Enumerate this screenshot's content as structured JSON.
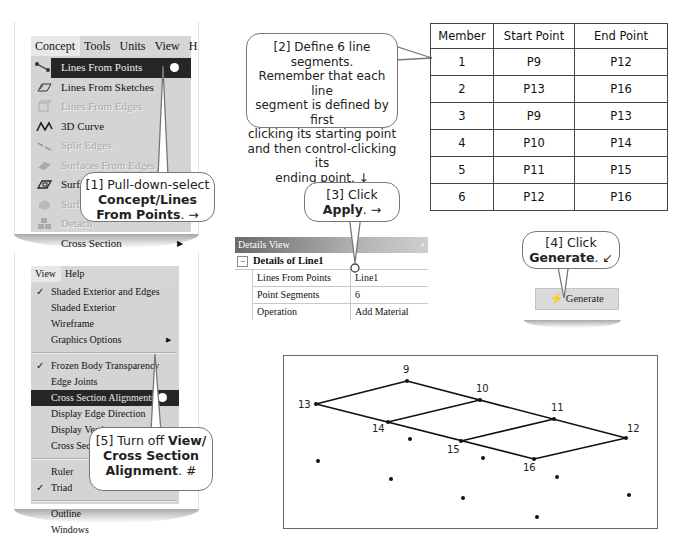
{
  "concept_menu": {
    "menubar": [
      "Concept",
      "Tools",
      "Units",
      "View",
      "H"
    ],
    "items": [
      {
        "label": "Lines From Points",
        "icon": "lines-from-points-icon",
        "state": "active"
      },
      {
        "label": "Lines From Sketches",
        "icon": "lines-from-sketches-icon",
        "state": "enabled"
      },
      {
        "label": "Lines From Edges",
        "icon": "lines-from-edges-icon",
        "state": "disabled"
      },
      {
        "label": "3D Curve",
        "icon": "3d-curve-icon",
        "state": "enabled"
      },
      {
        "label": "Split Edges",
        "icon": "split-edges-icon",
        "state": "disabled"
      },
      {
        "label": "Surfaces From Edges",
        "icon": "surfaces-from-edges-icon",
        "state": "disabled"
      },
      {
        "label": "Surfaces From Sketches",
        "icon": "surfaces-from-sketches-icon",
        "state": "enabled"
      },
      {
        "label": "Surfaces From Faces",
        "icon": "surfaces-from-faces-icon",
        "state": "disabled"
      },
      {
        "label": "Detach",
        "icon": "detach-icon",
        "state": "disabled"
      },
      {
        "label": "Cross Section",
        "icon": "",
        "state": "submenu"
      }
    ]
  },
  "view_menu": {
    "menubar": [
      "View",
      "Help"
    ],
    "groups": [
      [
        {
          "label": "Shaded Exterior and Edges",
          "checked": true
        },
        {
          "label": "Shaded Exterior",
          "checked": false
        },
        {
          "label": "Wireframe",
          "checked": false
        },
        {
          "label": "Graphics Options",
          "checked": false,
          "submenu": true
        }
      ],
      [
        {
          "label": "Frozen Body Transparency",
          "checked": true
        },
        {
          "label": "Edge Joints",
          "checked": false
        },
        {
          "label": "Cross Section Alignments",
          "checked": false,
          "active": true
        },
        {
          "label": "Display Edge Direction",
          "checked": false
        },
        {
          "label": "Display Vertices",
          "checked": false
        },
        {
          "label": "Cross Section Solids",
          "checked": false
        }
      ],
      [
        {
          "label": "Ruler",
          "checked": false
        },
        {
          "label": "Triad",
          "checked": true
        }
      ],
      [
        {
          "label": "Outline",
          "checked": false
        },
        {
          "label": "Windows",
          "checked": false
        }
      ]
    ]
  },
  "callouts": {
    "c1": {
      "prefix": "[1] Pull-down-select",
      "bold": "Concept/Lines From Points",
      "suffix": ". →"
    },
    "c2": {
      "text1": "[2] Define 6 line segments.",
      "text2": "Remember that each line",
      "text3": "segment is defined by first",
      "text4": "clicking its starting point",
      "text5": "and then control-clicking its",
      "text6": "ending point. ↓"
    },
    "c3": {
      "prefix": "[3] Click",
      "bold": "Apply",
      "suffix": ". →"
    },
    "c4": {
      "prefix": "[4] Click",
      "bold": "Generate",
      "suffix": ". ↙"
    },
    "c5": {
      "prefix": "[5] Turn off",
      "bold1": "View/",
      "bold2": "Cross Section",
      "bold3": "Alignment",
      "suffix": ". #"
    }
  },
  "segments_table": {
    "headers": [
      "Member",
      "Start Point",
      "End Point"
    ],
    "rows": [
      [
        "1",
        "P9",
        "P12"
      ],
      [
        "2",
        "P13",
        "P16"
      ],
      [
        "3",
        "P9",
        "P13"
      ],
      [
        "4",
        "P10",
        "P14"
      ],
      [
        "5",
        "P11",
        "P15"
      ],
      [
        "6",
        "P12",
        "P16"
      ]
    ]
  },
  "details_view": {
    "title": "Details View",
    "pin": "ᵖ",
    "section": "Details of Line1",
    "rows": [
      {
        "key": "Lines From Points",
        "value": "Line1"
      },
      {
        "key": "Point Segments",
        "value": "6"
      },
      {
        "key": "Operation",
        "value": "Add Material"
      }
    ]
  },
  "generate_button": {
    "label": "Generate"
  },
  "sketch": {
    "labeled_points": [
      {
        "id": "9",
        "x": 407,
        "y": 381
      },
      {
        "id": "10",
        "x": 480,
        "y": 400
      },
      {
        "id": "11",
        "x": 554,
        "y": 419
      },
      {
        "id": "12",
        "x": 626,
        "y": 438
      },
      {
        "id": "13",
        "x": 316,
        "y": 404
      },
      {
        "id": "14",
        "x": 388,
        "y": 422
      },
      {
        "id": "15",
        "x": 461,
        "y": 441
      },
      {
        "id": "16",
        "x": 534,
        "y": 459
      }
    ],
    "unlabeled_points": [
      {
        "x": 410,
        "y": 439
      },
      {
        "x": 483,
        "y": 458
      },
      {
        "x": 557,
        "y": 477
      },
      {
        "x": 318,
        "y": 461
      },
      {
        "x": 391,
        "y": 479
      },
      {
        "x": 463,
        "y": 498
      },
      {
        "x": 537,
        "y": 517
      },
      {
        "x": 629,
        "y": 495
      }
    ]
  }
}
